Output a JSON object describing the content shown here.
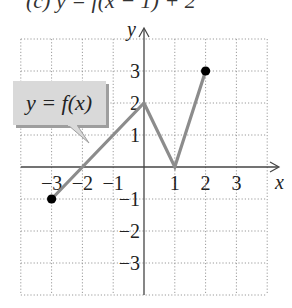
{
  "header": {
    "partial_title": "(c)  y = f(x − 1) + 2"
  },
  "callout": {
    "label": "y = f(x)"
  },
  "axes": {
    "x_label": "x",
    "y_label": "y"
  },
  "colors": {
    "curve": "#8c8c8c",
    "grid": "#9a9a9a",
    "axis": "#444444",
    "callout_fill": "#d9d9d9",
    "callout_shadow": "#9e9e9e",
    "point": "#000000"
  },
  "chart_data": {
    "type": "line",
    "title": "y = f(x)",
    "xlabel": "x",
    "ylabel": "y",
    "xlim": [
      -4,
      4
    ],
    "ylim": [
      -4,
      4
    ],
    "grid": true,
    "x_ticks": [
      -3,
      -2,
      -1,
      1,
      2,
      3
    ],
    "y_ticks": [
      -3,
      -2,
      -1,
      1,
      2,
      3
    ],
    "x_tick_labels": [
      "−3",
      "−2",
      "−1",
      "1",
      "2",
      "3"
    ],
    "y_tick_labels": [
      "−3",
      "−2",
      "−1",
      "1",
      "2",
      "3"
    ],
    "series": [
      {
        "name": "y = f(x)",
        "points": [
          [
            -3,
            -1
          ],
          [
            0,
            2
          ],
          [
            1,
            0
          ],
          [
            2,
            3
          ]
        ],
        "endpoints_closed": [
          [
            -3,
            -1
          ],
          [
            2,
            3
          ]
        ]
      }
    ],
    "annotations": [
      {
        "text": "y = f(x)",
        "type": "callout",
        "points_to": [
          -1.8,
          0.2
        ]
      }
    ]
  }
}
